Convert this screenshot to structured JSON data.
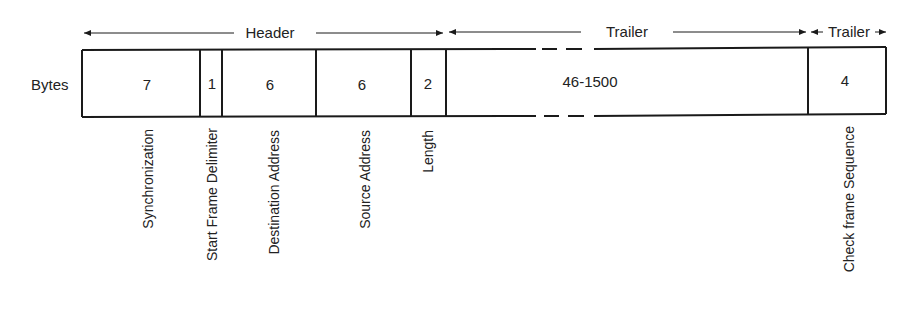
{
  "diagram": {
    "row_label": "Bytes",
    "colors": {
      "stroke": "#1a1a1a",
      "text": "#222222",
      "background": "#ffffff"
    },
    "sections": [
      {
        "id": "header",
        "label": "Header",
        "x_start": 84,
        "x_end": 444,
        "label_x": 270
      },
      {
        "id": "data-field",
        "label": "Data Field",
        "x_start": 448,
        "x_end": 806,
        "label_x": 628
      },
      {
        "id": "trailer",
        "label": "Trailer",
        "x_start": 810,
        "x_end": 886,
        "label_x": 848
      }
    ],
    "fields": [
      {
        "id": "synchronization",
        "bytes": "7",
        "name": "Synchronization",
        "x_start": 82,
        "x_end": 200
      },
      {
        "id": "start-frame-delimiter",
        "bytes": "1",
        "name": "Start Frame Delimiter",
        "x_start": 200,
        "x_end": 222
      },
      {
        "id": "destination-address",
        "bytes": "6",
        "name": "Destination Address",
        "x_start": 222,
        "x_end": 316
      },
      {
        "id": "source-address",
        "bytes": "6",
        "name": "Source Address",
        "x_start": 316,
        "x_end": 411
      },
      {
        "id": "length",
        "bytes": "2",
        "name": "Length",
        "x_start": 411,
        "x_end": 446
      },
      {
        "id": "data",
        "bytes": "46-1500",
        "name": "",
        "x_start": 446,
        "x_end": 808
      },
      {
        "id": "check-frame-sequence",
        "bytes": "4",
        "name": "Check frame Sequence",
        "x_start": 808,
        "x_end": 886
      }
    ]
  }
}
